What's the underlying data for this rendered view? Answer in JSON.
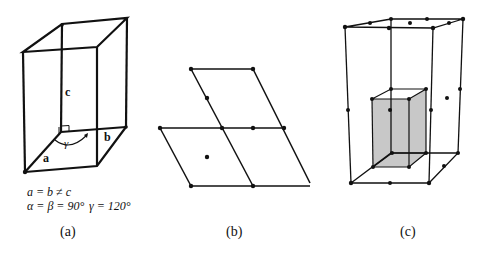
{
  "figure_a": {
    "caption": "(a)",
    "axis_labels": {
      "a": "a",
      "b": "b",
      "c": "c"
    },
    "angle_label": "γ",
    "relation_line1": "a = b ≠ c",
    "relation_line2_part1": "α = β = 90°",
    "relation_line2_part2": "γ = 120°"
  },
  "figure_b": {
    "caption": "(b)"
  },
  "figure_c": {
    "caption": "(c)",
    "inner_box_color": "#c8c8c8"
  }
}
